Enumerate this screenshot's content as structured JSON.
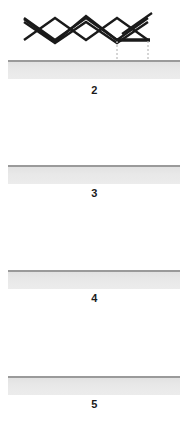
{
  "figure": {
    "background_color": "#ffffff",
    "width": 189,
    "height": 424,
    "bond_color": "#1a1a1a",
    "surface_top_line_color": "#9a9a9a",
    "surface_fill_color": "#e8e8e8",
    "dotted_line_color": "#c8c8c8"
  },
  "panels": [
    {
      "label": "2",
      "name": "structure-2",
      "description": "pent-1-ene zigzag chain with terminal double bond, drawn above a gray surface",
      "label_x": 94,
      "label_y": 84,
      "surface_line_y": 60,
      "surface_bar_y": 62,
      "skeleton_points": "24,22 55,43 86,22 117,43 148,22",
      "double_bond_points": "122,34 152,13",
      "dotted_verticals": [],
      "bold_segments": []
    },
    {
      "label": "3",
      "name": "structure-3",
      "description": "zigzag chain ending in a bold horizontal bond, with two dotted projection lines to the surface",
      "label_x": 94,
      "label_y": 187,
      "surface_line_y": 165,
      "surface_bar_y": 167,
      "skeleton_points": "24,124 55,147 86,121 117,145 148,145",
      "double_bond_points": "",
      "dotted_verticals": [
        {
          "x": 117,
          "y1": 146,
          "y2": 165
        },
        {
          "x": 148,
          "y1": 146,
          "y2": 165
        }
      ],
      "bold_segments": [
        {
          "x1": 117,
          "y1": 145,
          "x2": 150,
          "y2": 145
        }
      ]
    },
    {
      "label": "4",
      "name": "structure-4",
      "description": "W-shaped zigzag chain with one dotted projection line from the lower right vertex to the surface",
      "label_x": 94,
      "label_y": 292,
      "surface_line_y": 270,
      "surface_bar_y": 272,
      "skeleton_points": "24,228 55,250 86,228 117,250 148,228",
      "double_bond_points": "",
      "dotted_verticals": [
        {
          "x": 117,
          "y1": 251,
          "y2": 270
        }
      ],
      "bold_segments": []
    },
    {
      "label": "5",
      "name": "structure-5",
      "description": "M-shaped zigzag chain with a dotted projection line from the right end down to the surface",
      "label_x": 94,
      "label_y": 398,
      "surface_line_y": 376,
      "surface_bar_y": 378,
      "skeleton_points": "24,356 55,334 86,356 117,334 148,356",
      "double_bond_points": "",
      "dotted_verticals": [
        {
          "x": 148,
          "y1": 357,
          "y2": 376
        }
      ],
      "bold_segments": []
    }
  ]
}
